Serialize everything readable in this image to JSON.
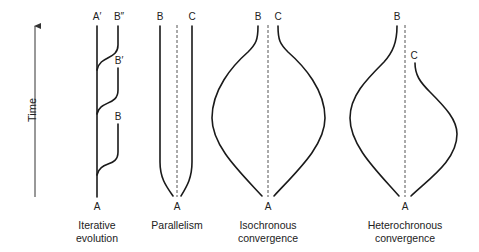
{
  "axis": {
    "label": "Time",
    "direction": "up"
  },
  "panels": [
    {
      "id": "iterative",
      "caption_line1": "Iterative",
      "caption_line2": "evolution",
      "labels": {
        "ancestor": "A",
        "trunk_top": "A′",
        "branch1": "B",
        "branch2": "B′",
        "branch3": "B″"
      }
    },
    {
      "id": "parallelism",
      "caption_line1": "Parallelism",
      "caption_line2": "",
      "labels": {
        "ancestor": "A",
        "left": "B",
        "right": "C"
      }
    },
    {
      "id": "isochronous",
      "caption_line1": "Isochronous",
      "caption_line2": "convergence",
      "labels": {
        "ancestor": "A",
        "left": "B",
        "right": "C"
      }
    },
    {
      "id": "heterochronous",
      "caption_line1": "Heterochronous",
      "caption_line2": "convergence",
      "labels": {
        "ancestor": "A",
        "left": "B",
        "right": "C"
      }
    }
  ],
  "colors": {
    "line": "#1a1a1a",
    "dashed": "#555555",
    "text": "#222222",
    "background": "#ffffff"
  }
}
